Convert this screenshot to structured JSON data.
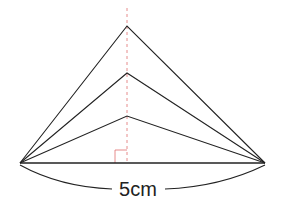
{
  "diagram": {
    "base_label": "5cm",
    "colors": {
      "line": "#222222",
      "axis": "#e07070",
      "right_angle": "#e07070",
      "background": "#ffffff"
    },
    "base": {
      "left": [
        20,
        163
      ],
      "right": [
        265,
        163
      ]
    },
    "apexes": [
      [
        127,
        26
      ],
      [
        127,
        73
      ],
      [
        127,
        116
      ]
    ],
    "axis": {
      "x": 127,
      "y_top": 8,
      "y_bottom": 163
    }
  }
}
